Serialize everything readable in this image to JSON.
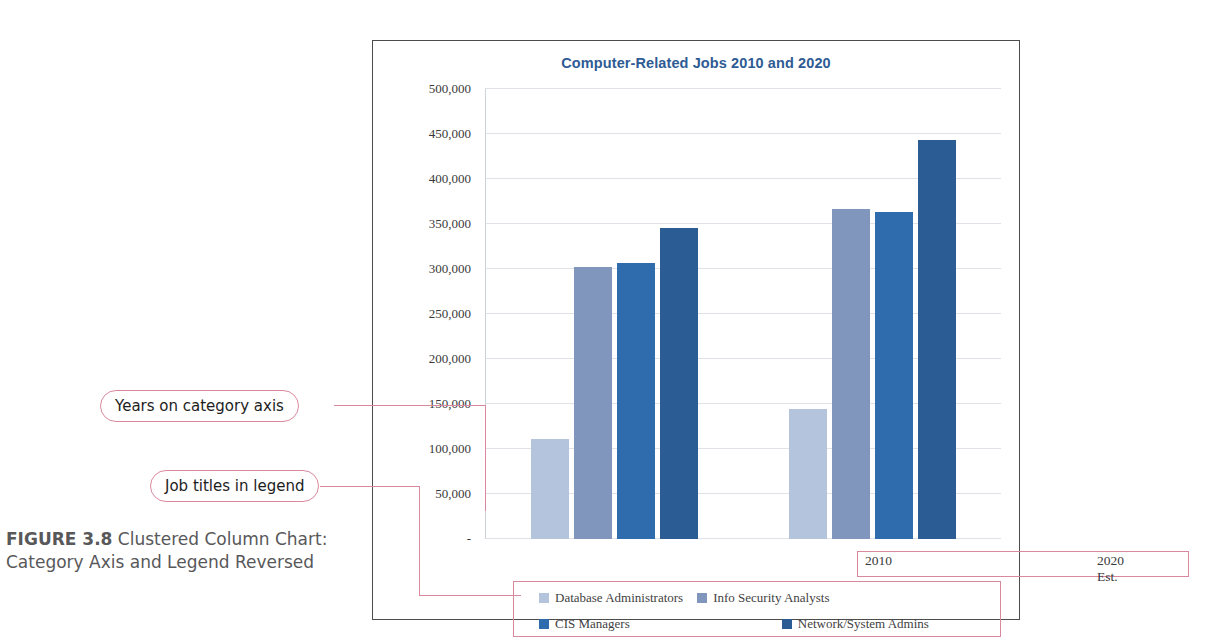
{
  "figure": {
    "label": "FIGURE 3.8",
    "caption": " Clustered Column Chart: Category Axis and Legend Reversed"
  },
  "annotations": [
    {
      "name": "years-on-category-axis",
      "text": "Years on category axis"
    },
    {
      "name": "job-titles-in-legend",
      "text": "Job titles in legend"
    }
  ],
  "colors": {
    "title": "#2e5b94",
    "annotation_outline": "#d9899e",
    "gridline": "#dfe3e8",
    "frame": "#4c4c4c",
    "series": [
      "#b4c4dc",
      "#8096bd",
      "#2f6cad",
      "#2b5c94"
    ]
  },
  "chart_data": {
    "type": "bar",
    "title": "Computer-Related Jobs 2010 and 2020",
    "xlabel": "",
    "ylabel": "",
    "categories": [
      "2010",
      "2020 Est."
    ],
    "series": [
      {
        "name": "Database Administrators",
        "color": "#b4c4dc",
        "values": [
          111000,
          144000
        ]
      },
      {
        "name": "Info Security Analysts",
        "color": "#8096bd",
        "values": [
          302000,
          367000
        ]
      },
      {
        "name": "CIS Managers",
        "color": "#2f6cad",
        "values": [
          307000,
          363000
        ]
      },
      {
        "name": "Network/System Admins",
        "color": "#2b5c94",
        "values": [
          346000,
          443000
        ]
      }
    ],
    "ylim": [
      0,
      500000
    ],
    "ytick_values": [
      0,
      50000,
      100000,
      150000,
      200000,
      250000,
      300000,
      350000,
      400000,
      450000,
      500000
    ],
    "ytick_labels": [
      "-",
      "50,000",
      "100,000",
      "150,000",
      "200,000",
      "250,000",
      "300,000",
      "350,000",
      "400,000",
      "450,000",
      "500,000"
    ],
    "grid": true,
    "legend_position": "bottom"
  }
}
